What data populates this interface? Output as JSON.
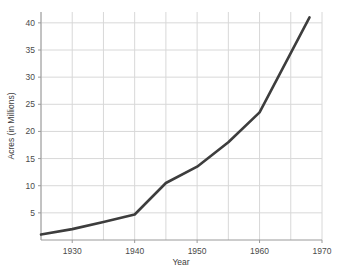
{
  "chart_data": {
    "type": "line",
    "title": "",
    "xlabel": "Year",
    "ylabel": "Acres (in Millions)",
    "xlim": [
      1925,
      1970
    ],
    "ylim": [
      0,
      42
    ],
    "grid": true,
    "legend": "none",
    "line_color": "#3d3d3d",
    "grid_color": "#d8d8d8",
    "axis_color": "#9a9a9a",
    "background_color": "#ffffff",
    "x_ticks": [
      1930,
      1940,
      1950,
      1960,
      1970
    ],
    "x_tick_labels": [
      "1930",
      "1940",
      "1950",
      "1960",
      "1970"
    ],
    "x_gridlines": [
      1925,
      1930,
      1935,
      1940,
      1945,
      1950,
      1955,
      1960,
      1965,
      1970
    ],
    "y_ticks": [
      5,
      10,
      15,
      20,
      25,
      30,
      35,
      40
    ],
    "y_tick_labels": [
      "5",
      "10",
      "15",
      "20",
      "25",
      "30",
      "35",
      "40"
    ],
    "series": [
      {
        "name": "Acres",
        "x": [
          1925,
          1930,
          1935,
          1940,
          1945,
          1950,
          1955,
          1960,
          1968
        ],
        "values": [
          1.0,
          2.0,
          3.3,
          4.7,
          10.5,
          13.5,
          18.0,
          23.5,
          41.0
        ]
      }
    ]
  }
}
